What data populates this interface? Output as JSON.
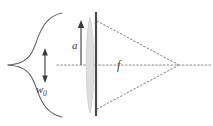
{
  "figure": {
    "canvas": {
      "width": 213,
      "height": 126,
      "background": "#ffffff"
    },
    "colors": {
      "curve": "#6b6b6b",
      "axis_dotted": "#8c8c8c",
      "ray_dotted": "#9a9a9a",
      "aperture_bar": "#4a4a4a",
      "lens_fill": "#dedede",
      "lens_stroke": "#c2c2c2",
      "arrow": "#3b3b3b",
      "label_text": "#3b3b3b"
    },
    "labels": [
      {
        "id": "beam-waist",
        "text": "w",
        "subscript": "0",
        "x": 40,
        "y": 88
      },
      {
        "id": "aperture-radius",
        "text": "a",
        "subscript": "",
        "x": 74,
        "y": 46
      },
      {
        "id": "focal-length",
        "text": "f",
        "subscript": "",
        "x": 118,
        "y": 68
      }
    ],
    "geometry": {
      "optical_axis": {
        "y": 65,
        "x_start": 57,
        "x_end": 211
      },
      "aperture_bar": {
        "x": 96,
        "y_top": 12,
        "y_bottom": 116,
        "width": 2
      },
      "lens": {
        "cx": 90,
        "cy": 65,
        "half_height": 50,
        "half_width": 5
      },
      "focus_point": {
        "x": 179,
        "y": 65
      },
      "aperture_arrow": {
        "x": 81,
        "y_tip": 22,
        "y_base": 65
      },
      "waist_arrow": {
        "x": 45,
        "y_top": 51,
        "y_bottom": 80
      },
      "gaussian_curve": {
        "peak_x": 15,
        "baseline_x": 62,
        "center_y": 65
      }
    }
  }
}
